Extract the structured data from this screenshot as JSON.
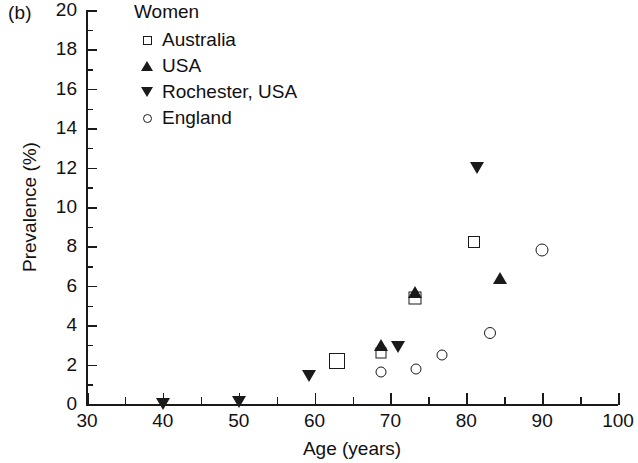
{
  "panel_label": "(b)",
  "chart_data": {
    "type": "scatter",
    "title": "",
    "xlabel": "Age (years)",
    "ylabel": "Prevalence (%)",
    "xlim": [
      30,
      100
    ],
    "ylim": [
      0,
      20
    ],
    "xticks": [
      30,
      40,
      50,
      60,
      70,
      80,
      90,
      100
    ],
    "xtick_labels": [
      "30",
      "40",
      "50",
      "60",
      "70",
      "80",
      "90",
      "100"
    ],
    "x_minor_ticks": [
      35,
      45,
      55,
      65,
      75,
      85,
      95
    ],
    "yticks": [
      0,
      2,
      4,
      6,
      8,
      10,
      12,
      14,
      16,
      18,
      20
    ],
    "ytick_labels": [
      "0",
      "2",
      "4",
      "6",
      "8",
      "10",
      "12",
      "14",
      "16",
      "18",
      "20"
    ],
    "y_minor_ticks": [
      1,
      3,
      5,
      7,
      9,
      11,
      13,
      15,
      17,
      19
    ],
    "grid": false,
    "legend_position": "top-left",
    "legend_title": "Women",
    "series": [
      {
        "name": "Australia",
        "marker": "square-open",
        "points": [
          {
            "x": 63.0,
            "y": 2.2,
            "size": 16
          },
          {
            "x": 68.7,
            "y": 2.6,
            "size": 11
          },
          {
            "x": 73.2,
            "y": 5.4,
            "size": 13
          },
          {
            "x": 81.0,
            "y": 8.2,
            "size": 12
          }
        ]
      },
      {
        "name": "USA",
        "marker": "triangle-up",
        "points": [
          {
            "x": 68.7,
            "y": 3.0
          },
          {
            "x": 73.2,
            "y": 5.7
          },
          {
            "x": 84.5,
            "y": 6.4
          }
        ]
      },
      {
        "name": "Rochester, USA",
        "marker": "triangle-down",
        "points": [
          {
            "x": 40.0,
            "y": 0.0
          },
          {
            "x": 50.0,
            "y": 0.1
          },
          {
            "x": 59.2,
            "y": 1.4
          },
          {
            "x": 71.0,
            "y": 2.9
          },
          {
            "x": 81.4,
            "y": 12.0
          }
        ]
      },
      {
        "name": "England",
        "marker": "circle-open",
        "points": [
          {
            "x": 68.8,
            "y": 1.6,
            "size": 11
          },
          {
            "x": 73.4,
            "y": 1.8,
            "size": 11
          },
          {
            "x": 76.8,
            "y": 2.5,
            "size": 11
          },
          {
            "x": 83.1,
            "y": 3.6,
            "size": 12
          },
          {
            "x": 90.0,
            "y": 7.8,
            "size": 13
          }
        ]
      }
    ]
  }
}
